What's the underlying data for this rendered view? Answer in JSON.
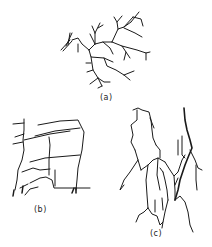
{
  "figure": {
    "panels": [
      {
        "id": "a",
        "label": "(a)",
        "description": "dendritic branching crack pattern"
      },
      {
        "id": "b",
        "label": "(b)",
        "description": "orthogonal blocky crack network"
      },
      {
        "id": "c",
        "label": "(c)",
        "description": "vertical columnar crack pattern"
      }
    ]
  },
  "colors": {
    "background": "#ffffff",
    "stroke": "#1a1a1a"
  }
}
